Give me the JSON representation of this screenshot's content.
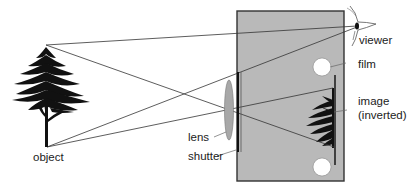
{
  "diagram": {
    "labels": {
      "object": "object",
      "lens": "lens",
      "shutter": "shutter",
      "viewer": "viewer",
      "film": "film",
      "image_line1": "image",
      "image_line2": "(inverted)"
    },
    "colors": {
      "camera_body": "#b9b9b9",
      "camera_border": "#333333",
      "ray": "#333333",
      "tree": "#111111",
      "lens": "#a8a8a8",
      "film_roll": "#ffffff"
    }
  }
}
